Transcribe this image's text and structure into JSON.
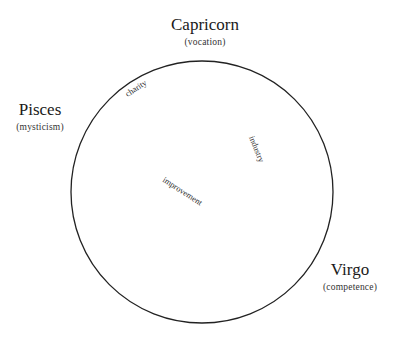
{
  "diagram": {
    "circle": {
      "cx": 202,
      "cy": 192,
      "r": 131,
      "stroke": "#222222"
    },
    "signs": [
      {
        "name": "Capricorn",
        "quality": "(vocation)"
      },
      {
        "name": "Pisces",
        "quality": "(mysticism)"
      },
      {
        "name": "Virgo",
        "quality": "(competence)"
      }
    ],
    "inner_labels": [
      {
        "text": "charity"
      },
      {
        "text": "industry"
      },
      {
        "text": "improvement"
      }
    ]
  }
}
